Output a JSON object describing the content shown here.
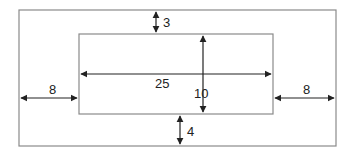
{
  "diagram": {
    "type": "dimensioned-nested-rectangles",
    "outer_rect": {
      "x": 19,
      "y": 10,
      "w": 317,
      "h": 136,
      "stroke": "#8a8a8a"
    },
    "inner_rect": {
      "x": 79,
      "y": 34,
      "w": 194,
      "h": 80,
      "stroke": "#8a8a8a"
    },
    "arrow_color": "#222222",
    "dimensions": {
      "top_margin": {
        "label": "3",
        "x": 156,
        "y1": 12,
        "y2": 32,
        "label_x": 163,
        "label_y": 27
      },
      "bottom_margin": {
        "label": "4",
        "x": 180,
        "y1": 116,
        "y2": 144,
        "label_x": 187,
        "label_y": 136
      },
      "left_margin": {
        "label": "8",
        "y": 98,
        "x1": 21,
        "x2": 77,
        "label_x": 49,
        "label_y": 94
      },
      "right_margin": {
        "label": "8",
        "y": 98,
        "x1": 275,
        "x2": 334,
        "label_x": 303,
        "label_y": 94
      },
      "inner_width": {
        "label": "25",
        "y": 74,
        "x1": 81,
        "x2": 271,
        "label_x": 155,
        "label_y": 88
      },
      "inner_height": {
        "label": "10",
        "x": 203,
        "y1": 36,
        "y2": 112,
        "label_x": 194,
        "label_y": 98
      }
    }
  }
}
